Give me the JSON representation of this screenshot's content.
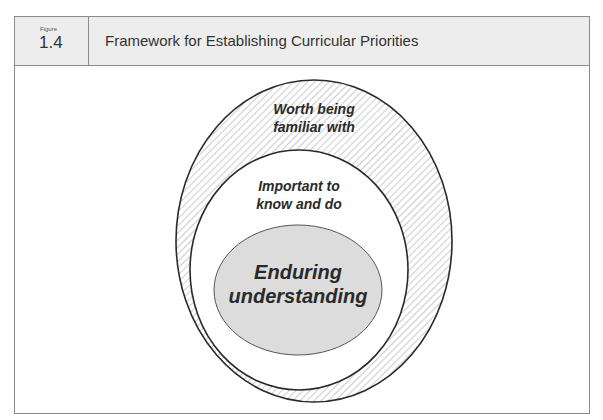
{
  "figure": {
    "label": "Figure",
    "number": "1.4",
    "title": "Framework for Establishing Curricular Priorities"
  },
  "diagram": {
    "outer": {
      "label_line1": "Worth being",
      "label_line2": "familiar with",
      "fill": "hatched",
      "stroke": "#2a2a2a"
    },
    "middle": {
      "label_line1": "Important to",
      "label_line2": "know and do",
      "fill": "#ffffff",
      "stroke": "#2a2a2a"
    },
    "inner": {
      "label_line1": "Enduring",
      "label_line2": "understanding",
      "fill": "#dcdcdc",
      "stroke": "#555555"
    }
  }
}
